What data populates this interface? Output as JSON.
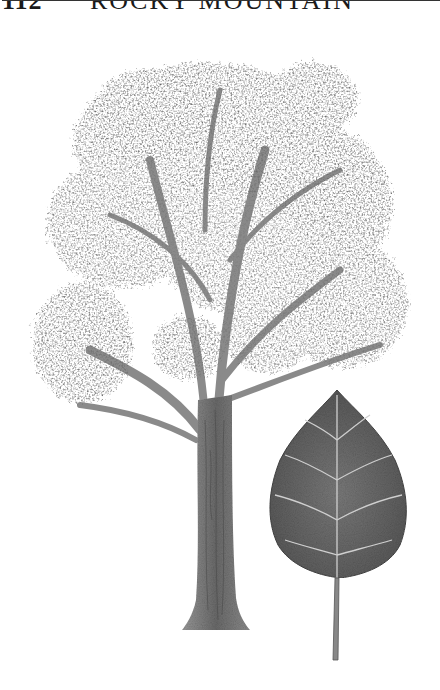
{
  "header": {
    "page_number": "112",
    "title": "ROCKY MOUNTAIN"
  },
  "illustration": {
    "subject": "tree",
    "detail": "leaf",
    "colors": {
      "foliage_dark": "#5a5a5a",
      "foliage_mid": "#8a8a8a",
      "trunk": "#7a7a7a",
      "leaf": "#6e6e6e",
      "vein": "#d8d8d8"
    }
  }
}
